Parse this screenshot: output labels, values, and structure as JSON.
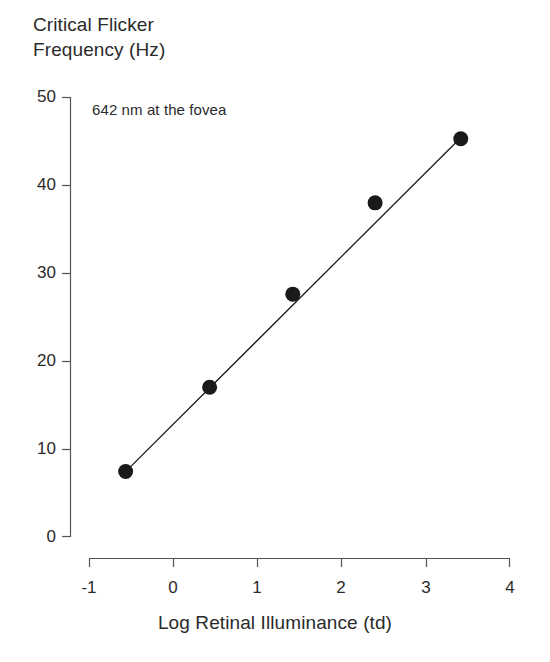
{
  "chart_data": {
    "type": "scatter",
    "title_line1": "Critical Flicker",
    "title_line2": "Frequency (Hz)",
    "xlabel": "Log Retinal Illuminance (td)",
    "ylabel": "Critical Flicker Frequency (Hz)",
    "annotation": "642 nm at the fovea",
    "xlim": [
      -1,
      4
    ],
    "ylim": [
      0,
      50
    ],
    "xticks": [
      -1,
      0,
      1,
      2,
      3,
      4
    ],
    "xtick_labels": [
      "-1",
      "0",
      "1",
      "2",
      "3",
      "4"
    ],
    "yticks": [
      0,
      10,
      20,
      30,
      40,
      50
    ],
    "ytick_labels": [
      "0",
      "10",
      "20",
      "30",
      "40",
      "50"
    ],
    "grid": false,
    "legend": false,
    "marker": "filled-circle",
    "marker_color": "#1a1a1a",
    "line_color": "#1a1a1a",
    "x": [
      -0.57,
      0.43,
      1.42,
      2.4,
      3.42
    ],
    "y": [
      7.4,
      17.0,
      27.6,
      38.0,
      45.3
    ],
    "points": [
      {
        "x": -0.57,
        "y": 7.4
      },
      {
        "x": 0.43,
        "y": 17.0
      },
      {
        "x": 1.42,
        "y": 27.6
      },
      {
        "x": 2.4,
        "y": 38.0
      },
      {
        "x": 3.42,
        "y": 45.3
      }
    ],
    "fit_line": {
      "x_start": -0.6,
      "y_start": 7.1,
      "x_end": 3.47,
      "y_end": 45.9
    }
  },
  "axes": {
    "axis_color": "#555555"
  }
}
